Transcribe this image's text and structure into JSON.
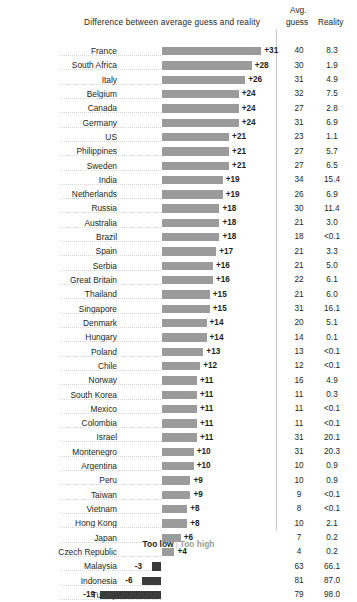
{
  "header": {
    "chart_title": "Difference between average guess and reality",
    "col_avg_top": "Avg.",
    "col_avg_bottom": "guess",
    "col_reality": "Reality"
  },
  "legend": {
    "too_low": "Too low",
    "separator": "|",
    "too_high": "Too high"
  },
  "colors": {
    "bar_positive": "#9b9b9b",
    "bar_negative": "#3b3b3b",
    "text": "#231f20",
    "divider": "#c9c9c9",
    "leader": "#d7d7d7"
  },
  "chart_data": {
    "type": "bar",
    "title": "Difference between average guess and reality",
    "xlabel": "",
    "ylabel": "",
    "orientation": "horizontal",
    "grid": false,
    "legend_position": "bottom",
    "xlim": [
      -19,
      31
    ],
    "zero_baseline": true,
    "categories": [
      "France",
      "South Africa",
      "Italy",
      "Belgium",
      "Canada",
      "Germany",
      "US",
      "Philippines",
      "Sweden",
      "India",
      "Netherlands",
      "Russia",
      "Australia",
      "Brazil",
      "Spain",
      "Serbia",
      "Great Britain",
      "Thailand",
      "Singapore",
      "Denmark",
      "Hungary",
      "Poland",
      "Chile",
      "Norway",
      "South Korea",
      "Mexico",
      "Colombia",
      "Israel",
      "Montenegro",
      "Argentina",
      "Peru",
      "Taiwan",
      "Vietnam",
      "Hong Kong",
      "Japan",
      "Czech Republic",
      "Malaysia",
      "Indonesia",
      "Turkey"
    ],
    "values": [
      31,
      28,
      26,
      24,
      24,
      24,
      21,
      21,
      21,
      19,
      19,
      18,
      18,
      18,
      17,
      16,
      16,
      15,
      15,
      14,
      14,
      13,
      12,
      11,
      11,
      11,
      11,
      11,
      10,
      10,
      9,
      9,
      8,
      8,
      6,
      4,
      -3,
      -6,
      -19
    ],
    "value_labels": [
      "+31",
      "+28",
      "+26",
      "+24",
      "+24",
      "+24",
      "+21",
      "+21",
      "+21",
      "+19",
      "+19",
      "+18",
      "+18",
      "+18",
      "+17",
      "+16",
      "+16",
      "+15",
      "+15",
      "+14",
      "+14",
      "+13",
      "+12",
      "+11",
      "+11",
      "+11",
      "+11",
      "+11",
      "+10",
      "+10",
      "+9",
      "+9",
      "+8",
      "+8",
      "+6",
      "+4",
      "-3",
      "-6",
      "-19"
    ],
    "series": [
      {
        "name": "Avg. guess",
        "values": [
          40,
          30,
          31,
          32,
          27,
          31,
          23,
          27,
          27,
          34,
          26,
          30,
          21,
          18,
          21,
          21,
          22,
          21,
          31,
          20,
          14,
          13,
          12,
          16,
          11,
          11,
          11,
          31,
          31,
          10,
          10,
          9,
          8,
          10,
          7,
          4,
          63,
          81,
          79
        ],
        "labels": [
          "40",
          "30",
          "31",
          "32",
          "27",
          "31",
          "23",
          "27",
          "27",
          "34",
          "26",
          "30",
          "21",
          "18",
          "21",
          "21",
          "22",
          "21",
          "31",
          "20",
          "14",
          "13",
          "12",
          "16",
          "11",
          "11",
          "11",
          "31",
          "31",
          "10",
          "10",
          "9",
          "8",
          "10",
          "7",
          "4",
          "63",
          "81",
          "79"
        ]
      },
      {
        "name": "Reality",
        "values": [
          8.3,
          1.9,
          4.9,
          7.5,
          2.8,
          6.9,
          1.1,
          5.7,
          6.5,
          15.4,
          6.9,
          11.4,
          3.0,
          0.05,
          3.3,
          5.0,
          6.1,
          6.0,
          16.1,
          5.1,
          0.1,
          0.05,
          0.05,
          4.9,
          0.3,
          0.05,
          0.05,
          20.1,
          20.3,
          0.9,
          0.9,
          0.05,
          0.05,
          2.1,
          0.2,
          0.2,
          66.1,
          87.0,
          98.0
        ],
        "labels": [
          "8.3",
          "1.9",
          "4.9",
          "7.5",
          "2.8",
          "6.9",
          "1.1",
          "5.7",
          "6.5",
          "15.4",
          "6.9",
          "11.4",
          "3.0",
          "<0.1",
          "3.3",
          "5.0",
          "6.1",
          "6.0",
          "16.1",
          "5.1",
          "0.1",
          "<0.1",
          "<0.1",
          "4.9",
          "0.3",
          "<0.1",
          "<0.1",
          "20.1",
          "20.3",
          "0.9",
          "0.9",
          "<0.1",
          "<0.1",
          "2.1",
          "0.2",
          "0.2",
          "66.1",
          "87.0",
          "98.0"
        ]
      }
    ],
    "legend_entries": [
      "Too low",
      "Too high"
    ]
  }
}
